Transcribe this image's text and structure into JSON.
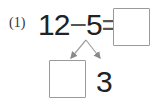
{
  "problem": {
    "label": "(1)",
    "minuend": "12",
    "operator": "−",
    "subtrahend": "5",
    "equals": "=",
    "answer_box": "",
    "decomposition": {
      "left_box": "",
      "right_value": "3"
    }
  },
  "colors": {
    "text": "#222222",
    "box_border": "#9a9a9a",
    "arrow": "#9a9a9a"
  }
}
